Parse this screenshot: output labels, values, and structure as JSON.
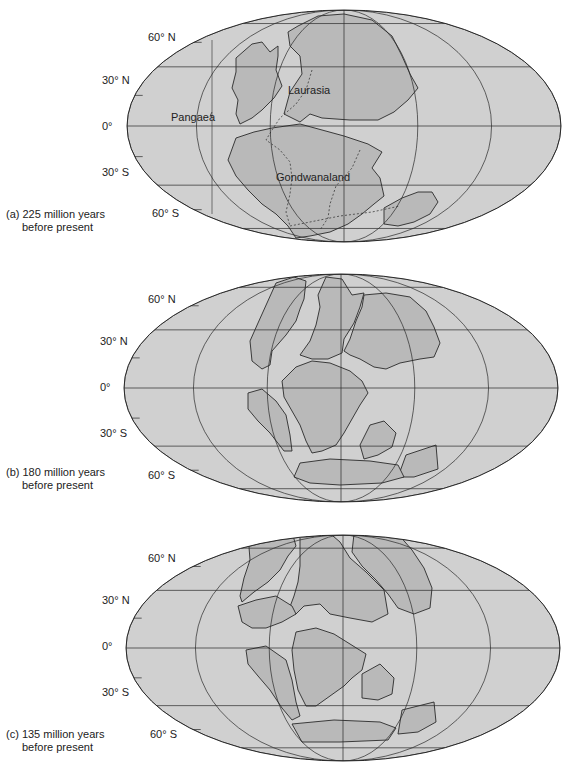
{
  "figure": {
    "colors": {
      "ocean": "#d0d0d0",
      "land": "#b9b9b9",
      "line": "#2a2a2a"
    },
    "latitude_labels": [
      "60° N",
      "30° N",
      "0°",
      "30° S",
      "60° S"
    ],
    "panels": [
      {
        "id": "a",
        "caption_line1": "(a) 225 million years",
        "caption_line2": "before present",
        "labels": {
          "pangaea": "Pangaea",
          "laurasia": "Laurasia",
          "gondwanaland": "Gondwanaland"
        }
      },
      {
        "id": "b",
        "caption_line1": "(b) 180 million years",
        "caption_line2": "before present"
      },
      {
        "id": "c",
        "caption_line1": "(c) 135 million years",
        "caption_line2": "before present"
      }
    ]
  }
}
